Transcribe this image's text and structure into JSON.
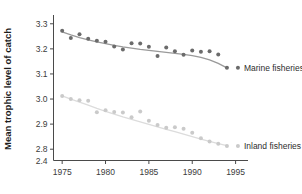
{
  "chart_data": {
    "type": "scatter",
    "title": "",
    "xlabel": "",
    "ylabel": "Mean trophic level of catch",
    "xlim": [
      1974.0,
      1996.2
    ],
    "ylim": [
      2.755,
      3.325
    ],
    "xticks": [
      1975,
      1980,
      1985,
      1990,
      1995
    ],
    "xticklabels": [
      "1975",
      "1980",
      "1985",
      "1990",
      "1995"
    ],
    "yticks": [
      3.3,
      3.2,
      3.1,
      3.0,
      2.9,
      2.8
    ],
    "yticklabels": [
      "3.3",
      "3.2",
      "3.1",
      "3.0",
      "2.9",
      "2.8"
    ],
    "y_axis_break": true,
    "y_origin_label": "2.4",
    "grid": false,
    "legend_position": "inline-right",
    "marker_shape": "circle",
    "series": [
      {
        "name": "Marine fisheries",
        "label": "Marine fisheries",
        "color": "#6b6b6b",
        "line_color": "#9a9a9a",
        "marker_size": 4.0,
        "x": [
          1975,
          1976,
          1977,
          1978,
          1979,
          1980,
          1981,
          1982,
          1983,
          1984,
          1985,
          1986,
          1987,
          1988,
          1989,
          1990,
          1991,
          1992,
          1993,
          1994
        ],
        "values": [
          3.272,
          3.243,
          3.258,
          3.24,
          3.232,
          3.228,
          3.209,
          3.197,
          3.222,
          3.221,
          3.208,
          3.172,
          3.205,
          3.19,
          3.177,
          3.193,
          3.188,
          3.19,
          3.178,
          3.125
        ],
        "trend": [
          [
            1975,
            3.268
          ],
          [
            1976,
            3.256
          ],
          [
            1977,
            3.245
          ],
          [
            1978,
            3.236
          ],
          [
            1979,
            3.228
          ],
          [
            1980,
            3.221
          ],
          [
            1981,
            3.214
          ],
          [
            1982,
            3.208
          ],
          [
            1983,
            3.203
          ],
          [
            1984,
            3.198
          ],
          [
            1985,
            3.194
          ],
          [
            1986,
            3.19
          ],
          [
            1987,
            3.186
          ],
          [
            1988,
            3.182
          ],
          [
            1989,
            3.178
          ],
          [
            1990,
            3.173
          ],
          [
            1991,
            3.166
          ],
          [
            1992,
            3.156
          ],
          [
            1993,
            3.142
          ],
          [
            1994,
            3.124
          ]
        ]
      },
      {
        "name": "Inland fisheries",
        "label": "Inland fisheries",
        "color": "#cacaca",
        "line_color": "#dcdcdc",
        "marker_size": 4.0,
        "x": [
          1975,
          1976,
          1977,
          1978,
          1979,
          1980,
          1981,
          1982,
          1983,
          1984,
          1985,
          1986,
          1987,
          1988,
          1989,
          1990,
          1991,
          1992,
          1993,
          1994
        ],
        "values": [
          3.012,
          3.0,
          2.995,
          2.993,
          2.947,
          2.955,
          2.948,
          2.946,
          2.927,
          2.95,
          2.913,
          2.897,
          2.886,
          2.888,
          2.882,
          2.866,
          2.844,
          2.831,
          2.822,
          2.813
        ],
        "trend": [
          [
            1975,
            3.013
          ],
          [
            1976,
            3.0
          ],
          [
            1977,
            2.988
          ],
          [
            1978,
            2.976
          ],
          [
            1979,
            2.963
          ],
          [
            1980,
            2.951
          ],
          [
            1981,
            2.94
          ],
          [
            1982,
            2.929
          ],
          [
            1983,
            2.919
          ],
          [
            1984,
            2.909
          ],
          [
            1985,
            2.899
          ],
          [
            1986,
            2.889
          ],
          [
            1987,
            2.879
          ],
          [
            1988,
            2.87
          ],
          [
            1989,
            2.86
          ],
          [
            1990,
            2.85
          ],
          [
            1991,
            2.84
          ],
          [
            1992,
            2.831
          ],
          [
            1993,
            2.822
          ],
          [
            1994,
            2.814
          ]
        ]
      }
    ]
  }
}
